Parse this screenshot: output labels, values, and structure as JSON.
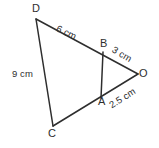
{
  "figure": {
    "type": "geometry-diagram",
    "background_color": "#ffffff",
    "stroke_color": "#2e2e2e",
    "text_color": "#2e2e2e",
    "vertices": [
      {
        "id": "D",
        "label": "D",
        "x": 36,
        "y": 19
      },
      {
        "id": "B",
        "label": "B",
        "x": 103,
        "y": 52
      },
      {
        "id": "O",
        "label": "O",
        "x": 138,
        "y": 74
      },
      {
        "id": "A",
        "label": "A",
        "x": 101,
        "y": 98
      },
      {
        "id": "C",
        "label": "C",
        "x": 53,
        "y": 126
      }
    ],
    "segments": [
      {
        "id": "DO",
        "from": "D",
        "to": "O",
        "through": "B"
      },
      {
        "id": "CO",
        "from": "C",
        "to": "O",
        "through": "A"
      },
      {
        "id": "DC",
        "from": "D",
        "to": "C"
      },
      {
        "id": "BA",
        "from": "B",
        "to": "A"
      }
    ],
    "measurements": [
      {
        "id": "DB",
        "segment": "D-B",
        "text": "6 cm",
        "rotation_deg": 26
      },
      {
        "id": "BO",
        "segment": "B-O",
        "text": "3 cm",
        "rotation_deg": 31
      },
      {
        "id": "AO",
        "segment": "A-O",
        "text": "2.5 cm",
        "rotation_deg": -32
      },
      {
        "id": "DC",
        "segment": "D-C",
        "text": "9 cm",
        "rotation_deg": 0
      }
    ]
  }
}
